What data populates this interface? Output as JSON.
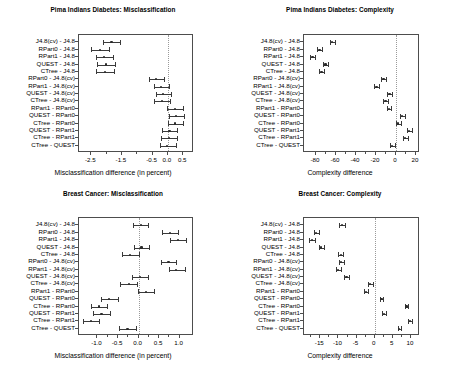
{
  "figure": {
    "width": 453,
    "height": 375,
    "background": "#ffffff",
    "line_color": "#3a3a3a",
    "axis_color": "#4d4d4d",
    "zero_line_color": "#9a9a9a"
  },
  "comparisons": [
    "J4.8(cv) - J4.8",
    "RPart0 - J4.8",
    "RPart1 - J4.8",
    "QUEST - J4.8",
    "CTree - J4.8",
    "RPart0 - J4.8(cv)",
    "RPart1 - J4.8(cv)",
    "QUEST - J4.8(cv)",
    "CTree - J4.8(cv)",
    "RPart1 - RPart0",
    "QUEST - RPart0",
    "CTree - RPart0",
    "QUEST - RPart1",
    "CTree - RPart1",
    "CTree - QUEST"
  ],
  "chart_data": [
    {
      "id": "pima-misclassification",
      "type": "errorbar",
      "title": "Pima Indians Diabetes: Misclassification",
      "xlabel": "Misclassification difference (in percent)",
      "ylabel": "",
      "xlim": [
        -2.9,
        0.85
      ],
      "xticks": [
        -2.5,
        -1.5,
        -0.5,
        0.0,
        0.5
      ],
      "xticklabels": [
        "-2.5",
        "-1.5",
        "-0.5",
        "0.0",
        "0.5"
      ],
      "xminorticks": [
        -2.0,
        -1.0
      ],
      "zero_reference": 0.0,
      "grid": false,
      "legend": "none",
      "categories": [
        "J4.8(cv) - J4.8",
        "RPart0 - J4.8",
        "RPart1 - J4.8",
        "QUEST - J4.8",
        "CTree - J4.8",
        "RPart0 - J4.8(cv)",
        "RPart1 - J4.8(cv)",
        "QUEST - J4.8(cv)",
        "CTree - J4.8(cv)",
        "RPart1 - RPart0",
        "QUEST - RPart0",
        "CTree - RPart0",
        "QUEST - RPart1",
        "CTree - RPart1",
        "CTree - QUEST"
      ],
      "estimates": [
        -1.84,
        -2.22,
        -2.08,
        -2.01,
        -2.05,
        -0.38,
        -0.22,
        -0.15,
        -0.2,
        0.22,
        0.27,
        0.24,
        0.05,
        0.04,
        -0.02
      ],
      "lower": [
        -2.13,
        -2.52,
        -2.36,
        -2.31,
        -2.33,
        -0.62,
        -0.46,
        -0.4,
        -0.47,
        -0.03,
        0.03,
        0.0,
        -0.19,
        -0.21,
        -0.27
      ],
      "upper": [
        -1.55,
        -1.93,
        -1.79,
        -1.71,
        -1.76,
        -0.14,
        0.02,
        0.1,
        0.06,
        0.49,
        0.53,
        0.5,
        0.3,
        0.29,
        0.25
      ]
    },
    {
      "id": "pima-complexity",
      "type": "errorbar",
      "title": "Pima Indians Diabetes: Complexity",
      "xlabel": "Complexity difference",
      "ylabel": "",
      "xlim": [
        -92,
        24
      ],
      "xticks": [
        -80,
        -60,
        -40,
        -20,
        0,
        20
      ],
      "xticklabels": [
        "-80",
        "-60",
        "-40",
        "-20",
        "0",
        "20"
      ],
      "xminorticks": [
        -70,
        -50,
        -30,
        -10,
        10
      ],
      "zero_reference": 0,
      "grid": false,
      "legend": "none",
      "categories": [
        "J4.8(cv) - J4.8",
        "RPart0 - J4.8",
        "RPart1 - J4.8",
        "QUEST - J4.8",
        "CTree - J4.8",
        "RPart0 - J4.8(cv)",
        "RPart1 - J4.8(cv)",
        "QUEST - J4.8(cv)",
        "CTree - J4.8(cv)",
        "RPart1 - RPart0",
        "QUEST - RPart0",
        "CTree - RPart0",
        "QUEST - RPart1",
        "CTree - RPart1",
        "CTree - QUEST"
      ],
      "estimates": [
        -64.0,
        -76.5,
        -83.5,
        -70.5,
        -74.5,
        -12.5,
        -19.5,
        -6.5,
        -10.5,
        -7.0,
        6.0,
        2.0,
        13.0,
        9.0,
        -4.0
      ],
      "lower": [
        -66.5,
        -79.0,
        -86.0,
        -73.0,
        -77.0,
        -15.0,
        -22.0,
        -9.0,
        -13.0,
        -9.0,
        3.5,
        -0.5,
        10.5,
        6.5,
        -6.5
      ],
      "upper": [
        -61.5,
        -74.0,
        -81.0,
        -68.0,
        -72.0,
        -10.0,
        -17.0,
        -4.0,
        -8.0,
        -5.0,
        8.5,
        4.5,
        15.5,
        11.5,
        -1.5
      ]
    },
    {
      "id": "breast-misclassification",
      "type": "errorbar",
      "title": "Breast Cancer: Misclassification",
      "xlabel": "Misclassification difference (in percent)",
      "ylabel": "",
      "xlim": [
        -1.45,
        1.35
      ],
      "xticks": [
        -1.0,
        -0.5,
        0.0,
        0.5,
        1.0
      ],
      "xticklabels": [
        "-1.0",
        "-0.5",
        "0.0",
        "0.5",
        "1.0"
      ],
      "xminorticks": [
        -0.75,
        -0.25,
        0.25,
        0.75
      ],
      "zero_reference": 0.0,
      "grid": false,
      "legend": "none",
      "categories": [
        "J4.8(cv) - J4.8",
        "RPart0 - J4.8",
        "RPart1 - J4.8",
        "QUEST - J4.8",
        "CTree - J4.8",
        "RPart0 - J4.8(cv)",
        "RPart1 - J4.8(cv)",
        "QUEST - J4.8(cv)",
        "CTree - J4.8(cv)",
        "RPart1 - RPart0",
        "QUEST - RPart0",
        "CTree - RPart0",
        "QUEST - RPart1",
        "CTree - RPart1",
        "CTree - QUEST"
      ],
      "estimates": [
        0.05,
        0.76,
        0.96,
        0.07,
        -0.2,
        0.73,
        0.92,
        0.04,
        -0.24,
        0.19,
        -0.71,
        -0.96,
        -0.9,
        -1.16,
        -0.27
      ],
      "lower": [
        -0.14,
        0.58,
        0.77,
        -0.12,
        -0.4,
        0.55,
        0.73,
        -0.15,
        -0.45,
        -0.01,
        -0.91,
        -1.17,
        -1.1,
        -1.36,
        -0.48
      ],
      "upper": [
        0.24,
        0.95,
        1.16,
        0.26,
        0.0,
        0.92,
        1.12,
        0.23,
        -0.03,
        0.38,
        -0.51,
        -0.76,
        -0.7,
        -0.96,
        -0.07
      ]
    },
    {
      "id": "breast-complexity",
      "type": "errorbar",
      "title": "Breast Cancer: Complexity",
      "xlabel": "Complexity difference",
      "ylabel": "",
      "xlim": [
        -19.5,
        12.5
      ],
      "xticks": [
        -15,
        -10,
        -5,
        0,
        5,
        10
      ],
      "xticklabels": [
        "-15",
        "-10",
        "-5",
        "0",
        "5",
        "10"
      ],
      "xminorticks": [
        -17.5,
        -12.5,
        -7.5,
        -2.5,
        2.5,
        7.5
      ],
      "zero_reference": 0,
      "grid": false,
      "legend": "none",
      "categories": [
        "J4.8(cv) - J4.8",
        "RPart0 - J4.8",
        "RPart1 - J4.8",
        "QUEST - J4.8",
        "CTree - J4.8",
        "RPart0 - J4.8(cv)",
        "RPart1 - J4.8(cv)",
        "QUEST - J4.8(cv)",
        "CTree - J4.8(cv)",
        "RPart1 - RPart0",
        "QUEST - RPart0",
        "CTree - RPart0",
        "QUEST - RPart1",
        "CTree - RPart1",
        "CTree - QUEST"
      ],
      "estimates": [
        -9.0,
        -16.1,
        -17.3,
        -14.7,
        -9.4,
        -9.2,
        -10.1,
        -7.8,
        -1.2,
        -2.4,
        1.9,
        8.8,
        2.6,
        9.8,
        6.8
      ],
      "lower": [
        -9.8,
        -16.8,
        -18.0,
        -15.4,
        -10.0,
        -9.9,
        -10.8,
        -8.4,
        -1.8,
        -2.9,
        1.4,
        8.3,
        2.1,
        9.3,
        6.3
      ],
      "upper": [
        -8.2,
        -15.4,
        -16.6,
        -14.0,
        -8.8,
        -8.5,
        -9.4,
        -7.2,
        -0.6,
        -1.9,
        2.4,
        9.3,
        3.1,
        10.3,
        7.3
      ]
    }
  ]
}
